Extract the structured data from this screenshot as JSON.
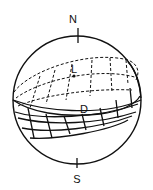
{
  "diagram": {
    "labels": {
      "north": "N",
      "south": "S",
      "lit_region": "L",
      "dark_region": "D"
    },
    "colors": {
      "stroke": "#111111",
      "background": "#ffffff"
    }
  }
}
